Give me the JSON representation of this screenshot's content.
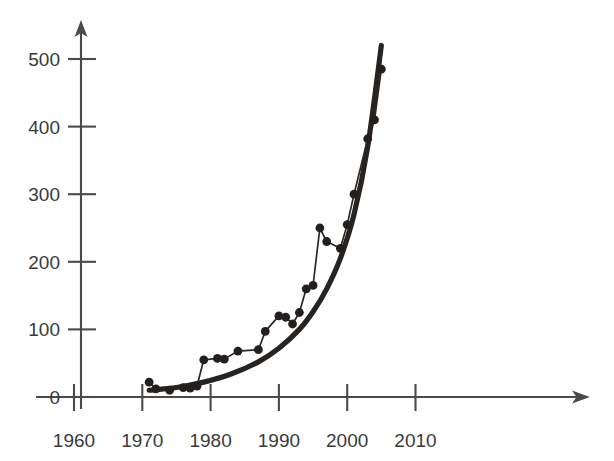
{
  "chart_data": {
    "type": "line",
    "title": "",
    "subtitle": "",
    "xlabel": "",
    "ylabel": "",
    "xlim": [
      1958,
      2017
    ],
    "ylim": [
      0,
      540
    ],
    "grid": false,
    "legend": "none",
    "x_ticks": [
      1960,
      1970,
      1980,
      1990,
      2000,
      2010
    ],
    "x_tick_labels": [
      "1960",
      "1970",
      "1980",
      "1990",
      "2000",
      "2010"
    ],
    "y_ticks": [
      0,
      100,
      200,
      300,
      400,
      500
    ],
    "y_tick_labels": [
      "0",
      "100",
      "200",
      "300",
      "400",
      "500"
    ],
    "axis_style": "arrow-ended",
    "series": [
      {
        "name": "data-points",
        "type": "line-with-markers",
        "marker": "filled-circle",
        "x": [
          1971,
          1972,
          1974,
          1976,
          1977,
          1978,
          1979,
          1981,
          1982,
          1984,
          1987,
          1988,
          1990,
          1991,
          1992,
          1993,
          1994,
          1995,
          1996,
          1997,
          1999,
          2000,
          2001,
          2003,
          2004,
          2005
        ],
        "values": [
          22,
          12,
          10,
          14,
          13,
          16,
          55,
          57,
          56,
          68,
          70,
          97,
          120,
          118,
          108,
          125,
          160,
          165,
          250,
          230,
          220,
          255,
          300,
          382,
          410,
          485
        ]
      },
      {
        "name": "exponential-trend-curve",
        "type": "smooth-curve",
        "marker": "none",
        "x": [
          1971,
          1975,
          1979,
          1983,
          1987,
          1990,
          1993,
          1995,
          1997,
          1999,
          2001,
          2003,
          2005
        ],
        "values": [
          10,
          14,
          22,
          34,
          52,
          72,
          100,
          126,
          160,
          205,
          270,
          370,
          520
        ]
      }
    ],
    "colors": {
      "axis": "#4a4a4a",
      "tick_label": "#3a3a3a",
      "series_line": "#2b2724",
      "series_marker": "#241f1d",
      "trend_curve": "#262321",
      "background": "#ffffff"
    }
  }
}
